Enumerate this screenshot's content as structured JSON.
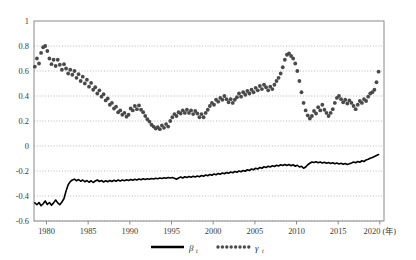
{
  "figure": {
    "title": "",
    "background_color": "#ffffff"
  },
  "axes": {
    "x_axis_unit_label": "(年)",
    "x_tick_labels": [
      "1980",
      "1985",
      "1990",
      "1995",
      "2000",
      "2005",
      "2010",
      "2015",
      "2020"
    ],
    "y_tick_labels": [
      "1",
      "0.8",
      "0.6",
      "0.4",
      "0.2",
      "0",
      "-0.2",
      "-0.4",
      "-0.6"
    ]
  },
  "legend": {
    "items": [
      {
        "name": "beta",
        "symbol": "β",
        "subscript": "t",
        "style": "solid-line",
        "color": "#000000"
      },
      {
        "name": "gamma",
        "symbol": "γ",
        "subscript": "t",
        "style": "dotted-markers",
        "color": "#555555"
      }
    ]
  },
  "chart_data": {
    "type": "line",
    "title": "",
    "xlabel": "(年)",
    "ylabel": "",
    "xlim": [
      1978.5,
      2020.5
    ],
    "ylim": [
      -0.6,
      1.0
    ],
    "grid": true,
    "grid_axis": "y",
    "y_ticks": [
      1,
      0.8,
      0.6,
      0.4,
      0.2,
      0,
      -0.2,
      -0.4,
      -0.6
    ],
    "x_ticks": [
      1980,
      1985,
      1990,
      1995,
      2000,
      2005,
      2010,
      2015,
      2020
    ],
    "legend_position": "bottom-center",
    "series": [
      {
        "name": "β",
        "id": "beta",
        "style": "solid",
        "color": "#000000",
        "linewidth": 1.6,
        "x": [
          1978.6,
          1978.85,
          1979.1,
          1979.35,
          1979.6,
          1979.85,
          1980.1,
          1980.35,
          1980.6,
          1980.85,
          1981.1,
          1981.35,
          1981.6,
          1981.85,
          1982.1,
          1982.35,
          1982.6,
          1982.85,
          1983.1,
          1983.35,
          1983.6,
          1983.85,
          1984.1,
          1984.35,
          1984.6,
          1984.85,
          1985.1,
          1985.35,
          1985.6,
          1985.85,
          1986.1,
          1986.35,
          1986.6,
          1986.85,
          1987.1,
          1987.35,
          1987.6,
          1987.85,
          1988.1,
          1988.35,
          1988.6,
          1988.85,
          1989.1,
          1989.35,
          1989.6,
          1989.85,
          1990.1,
          1990.35,
          1990.6,
          1990.85,
          1991.1,
          1991.35,
          1991.6,
          1991.85,
          1992.1,
          1992.35,
          1992.6,
          1992.85,
          1993.1,
          1993.35,
          1993.6,
          1993.85,
          1994.1,
          1994.35,
          1994.6,
          1994.85,
          1995.1,
          1995.35,
          1995.6,
          1995.85,
          1996.1,
          1996.35,
          1996.6,
          1996.85,
          1997.1,
          1997.35,
          1997.6,
          1997.85,
          1998.1,
          1998.35,
          1998.6,
          1998.85,
          1999.1,
          1999.35,
          1999.6,
          1999.85,
          2000.1,
          2000.35,
          2000.6,
          2000.85,
          2001.1,
          2001.35,
          2001.6,
          2001.85,
          2002.1,
          2002.35,
          2002.6,
          2002.85,
          2003.1,
          2003.35,
          2003.6,
          2003.85,
          2004.1,
          2004.35,
          2004.6,
          2004.85,
          2005.1,
          2005.35,
          2005.6,
          2005.85,
          2006.1,
          2006.35,
          2006.6,
          2006.85,
          2007.1,
          2007.35,
          2007.6,
          2007.85,
          2008.1,
          2008.35,
          2008.6,
          2008.85,
          2009.1,
          2009.35,
          2009.6,
          2009.85,
          2010.1,
          2010.35,
          2010.6,
          2010.85,
          2011.1,
          2011.35,
          2011.6,
          2011.85,
          2012.1,
          2012.35,
          2012.6,
          2012.85,
          2013.1,
          2013.35,
          2013.6,
          2013.85,
          2014.1,
          2014.35,
          2014.6,
          2014.85,
          2015.1,
          2015.35,
          2015.6,
          2015.85,
          2016.1,
          2016.35,
          2016.6,
          2016.85,
          2017.1,
          2017.35,
          2017.6,
          2017.85,
          2018.1,
          2018.35,
          2018.6,
          2018.85,
          2019.1,
          2019.35,
          2019.6,
          2019.85
        ],
        "y": [
          -0.455,
          -0.47,
          -0.452,
          -0.478,
          -0.462,
          -0.44,
          -0.468,
          -0.452,
          -0.474,
          -0.455,
          -0.432,
          -0.455,
          -0.47,
          -0.448,
          -0.42,
          -0.36,
          -0.31,
          -0.285,
          -0.272,
          -0.265,
          -0.278,
          -0.268,
          -0.282,
          -0.272,
          -0.286,
          -0.276,
          -0.29,
          -0.278,
          -0.292,
          -0.28,
          -0.272,
          -0.284,
          -0.276,
          -0.288,
          -0.278,
          -0.286,
          -0.276,
          -0.284,
          -0.274,
          -0.282,
          -0.272,
          -0.28,
          -0.272,
          -0.278,
          -0.27,
          -0.276,
          -0.268,
          -0.274,
          -0.266,
          -0.272,
          -0.264,
          -0.27,
          -0.262,
          -0.268,
          -0.262,
          -0.266,
          -0.26,
          -0.264,
          -0.258,
          -0.262,
          -0.256,
          -0.26,
          -0.254,
          -0.258,
          -0.252,
          -0.256,
          -0.252,
          -0.258,
          -0.266,
          -0.256,
          -0.248,
          -0.256,
          -0.246,
          -0.252,
          -0.244,
          -0.25,
          -0.242,
          -0.248,
          -0.24,
          -0.246,
          -0.236,
          -0.242,
          -0.232,
          -0.238,
          -0.228,
          -0.234,
          -0.224,
          -0.23,
          -0.22,
          -0.226,
          -0.216,
          -0.222,
          -0.212,
          -0.218,
          -0.208,
          -0.214,
          -0.204,
          -0.21,
          -0.2,
          -0.206,
          -0.196,
          -0.202,
          -0.19,
          -0.196,
          -0.184,
          -0.19,
          -0.178,
          -0.184,
          -0.172,
          -0.178,
          -0.166,
          -0.172,
          -0.162,
          -0.168,
          -0.158,
          -0.164,
          -0.154,
          -0.16,
          -0.15,
          -0.156,
          -0.148,
          -0.156,
          -0.148,
          -0.158,
          -0.15,
          -0.162,
          -0.154,
          -0.168,
          -0.162,
          -0.178,
          -0.168,
          -0.15,
          -0.138,
          -0.128,
          -0.132,
          -0.126,
          -0.134,
          -0.128,
          -0.136,
          -0.13,
          -0.138,
          -0.132,
          -0.14,
          -0.134,
          -0.142,
          -0.136,
          -0.144,
          -0.138,
          -0.146,
          -0.14,
          -0.148,
          -0.142,
          -0.136,
          -0.128,
          -0.134,
          -0.124,
          -0.13,
          -0.118,
          -0.124,
          -0.112,
          -0.106,
          -0.098,
          -0.092,
          -0.084,
          -0.076,
          -0.068
        ]
      },
      {
        "name": "γ",
        "id": "gamma",
        "style": "dotted-markers",
        "color": "#4a4a4a",
        "marker_size": 1.9,
        "x": [
          1978.6,
          1978.85,
          1979.1,
          1979.35,
          1979.6,
          1979.85,
          1980.1,
          1980.35,
          1980.6,
          1980.85,
          1981.1,
          1981.35,
          1981.6,
          1981.85,
          1982.1,
          1982.35,
          1982.6,
          1982.85,
          1983.1,
          1983.35,
          1983.6,
          1983.85,
          1984.1,
          1984.35,
          1984.6,
          1984.85,
          1985.1,
          1985.35,
          1985.6,
          1985.85,
          1986.1,
          1986.35,
          1986.6,
          1986.85,
          1987.1,
          1987.35,
          1987.6,
          1987.85,
          1988.1,
          1988.35,
          1988.6,
          1988.85,
          1989.1,
          1989.35,
          1989.6,
          1989.85,
          1990.1,
          1990.35,
          1990.6,
          1990.85,
          1991.1,
          1991.35,
          1991.6,
          1991.85,
          1992.1,
          1992.35,
          1992.6,
          1992.85,
          1993.1,
          1993.35,
          1993.6,
          1993.85,
          1994.1,
          1994.35,
          1994.6,
          1994.85,
          1995.1,
          1995.35,
          1995.6,
          1995.85,
          1996.1,
          1996.35,
          1996.6,
          1996.85,
          1997.1,
          1997.35,
          1997.6,
          1997.85,
          1998.1,
          1998.35,
          1998.6,
          1998.85,
          1999.1,
          1999.35,
          1999.6,
          1999.85,
          2000.1,
          2000.35,
          2000.6,
          2000.85,
          2001.1,
          2001.35,
          2001.6,
          2001.85,
          2002.1,
          2002.35,
          2002.6,
          2002.85,
          2003.1,
          2003.35,
          2003.6,
          2003.85,
          2004.1,
          2004.35,
          2004.6,
          2004.85,
          2005.1,
          2005.35,
          2005.6,
          2005.85,
          2006.1,
          2006.35,
          2006.6,
          2006.85,
          2007.1,
          2007.35,
          2007.6,
          2007.85,
          2008.1,
          2008.35,
          2008.6,
          2008.85,
          2009.1,
          2009.35,
          2009.6,
          2009.85,
          2010.1,
          2010.35,
          2010.6,
          2010.85,
          2011.1,
          2011.35,
          2011.6,
          2011.85,
          2012.1,
          2012.35,
          2012.6,
          2012.85,
          2013.1,
          2013.35,
          2013.6,
          2013.85,
          2014.1,
          2014.35,
          2014.6,
          2014.85,
          2015.1,
          2015.35,
          2015.6,
          2015.85,
          2016.1,
          2016.35,
          2016.6,
          2016.85,
          2017.1,
          2017.35,
          2017.6,
          2017.85,
          2018.1,
          2018.35,
          2018.6,
          2018.85,
          2019.1,
          2019.35,
          2019.6,
          2019.85
        ],
        "y": [
          0.635,
          0.7,
          0.66,
          0.745,
          0.79,
          0.8,
          0.76,
          0.7,
          0.655,
          0.69,
          0.64,
          0.69,
          0.65,
          0.61,
          0.655,
          0.62,
          0.58,
          0.61,
          0.57,
          0.6,
          0.545,
          0.575,
          0.52,
          0.555,
          0.5,
          0.53,
          0.475,
          0.505,
          0.45,
          0.47,
          0.42,
          0.445,
          0.395,
          0.415,
          0.365,
          0.38,
          0.33,
          0.345,
          0.3,
          0.315,
          0.27,
          0.285,
          0.25,
          0.265,
          0.235,
          0.25,
          0.3,
          0.285,
          0.32,
          0.295,
          0.325,
          0.29,
          0.27,
          0.24,
          0.215,
          0.195,
          0.17,
          0.155,
          0.14,
          0.15,
          0.135,
          0.165,
          0.145,
          0.175,
          0.155,
          0.2,
          0.23,
          0.255,
          0.24,
          0.27,
          0.26,
          0.285,
          0.265,
          0.29,
          0.265,
          0.285,
          0.255,
          0.28,
          0.26,
          0.23,
          0.255,
          0.23,
          0.265,
          0.29,
          0.32,
          0.345,
          0.33,
          0.37,
          0.355,
          0.385,
          0.37,
          0.4,
          0.375,
          0.35,
          0.375,
          0.345,
          0.37,
          0.39,
          0.42,
          0.395,
          0.43,
          0.41,
          0.44,
          0.42,
          0.45,
          0.43,
          0.465,
          0.445,
          0.48,
          0.455,
          0.49,
          0.47,
          0.445,
          0.475,
          0.455,
          0.49,
          0.52,
          0.545,
          0.58,
          0.63,
          0.69,
          0.73,
          0.74,
          0.72,
          0.7,
          0.66,
          0.6,
          0.52,
          0.43,
          0.345,
          0.285,
          0.245,
          0.22,
          0.24,
          0.28,
          0.26,
          0.31,
          0.285,
          0.33,
          0.29,
          0.265,
          0.24,
          0.265,
          0.295,
          0.345,
          0.385,
          0.4,
          0.375,
          0.35,
          0.37,
          0.34,
          0.365,
          0.345,
          0.32,
          0.295,
          0.33,
          0.36,
          0.345,
          0.375,
          0.36,
          0.395,
          0.42,
          0.43,
          0.45,
          0.51,
          0.595
        ]
      }
    ]
  }
}
